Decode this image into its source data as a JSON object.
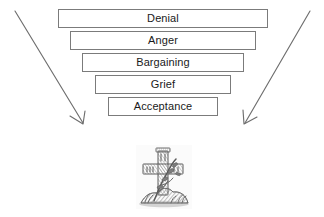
{
  "figure": {
    "background_color": "#ffffff",
    "width": 324,
    "height": 217
  },
  "funnel": {
    "description": "Inverted funnel of the five stages of grief",
    "box_border_color": "#7b7b7b",
    "box_fill_color": "#ffffff",
    "text_color": "#1a1a1a",
    "stages": [
      {
        "label": "Denial"
      },
      {
        "label": "Anger"
      },
      {
        "label": "Bargaining"
      },
      {
        "label": "Grief"
      },
      {
        "label": "Acceptance"
      }
    ]
  },
  "arrows": {
    "color": "#6e6e6e",
    "style": "open-v-arrowhead",
    "left": {
      "name": "left-converging-arrow"
    },
    "right": {
      "name": "right-converging-arrow"
    }
  },
  "illustration": {
    "name": "stone-cross-engraving",
    "subject": "cross monument with foliage",
    "style": "vintage grayscale engraving",
    "ink_color": "#6b6b6b"
  }
}
